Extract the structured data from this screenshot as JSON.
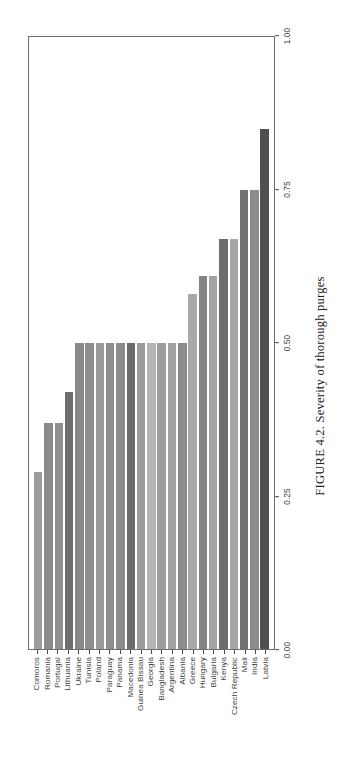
{
  "figure": {
    "caption_prefix": "FIGURE 4.2.",
    "caption_text": "Severity of thorough purges",
    "caption_full": "FIGURE 4.2. Severity of thorough purges",
    "rotation": "90deg-counterclockwise"
  },
  "chart_data": {
    "type": "bar",
    "orientation": "horizontal",
    "title": "",
    "xlabel": "",
    "ylabel": "",
    "xlim": [
      0,
      1.0
    ],
    "grid": false,
    "legend": "none",
    "tick_labels": [
      "0.00",
      "0.25",
      "0.50",
      "0.75",
      "1.00"
    ],
    "tick_values": [
      0.0,
      0.25,
      0.5,
      0.75,
      1.0
    ],
    "categories": [
      "Comoros",
      "Romania",
      "Portugal",
      "Lithuania",
      "Ukraine",
      "Tunisia",
      "Poland",
      "Paraguay",
      "Panama",
      "Macedonia",
      "Guinea Bissau",
      "Georgia",
      "Bangladesh",
      "Argentina",
      "Albania",
      "Greece",
      "Hungary",
      "Bulgaria",
      "Kenya",
      "Czech Republic",
      "Mali",
      "India",
      "Latvia"
    ],
    "values": [
      0.29,
      0.37,
      0.37,
      0.42,
      0.5,
      0.5,
      0.5,
      0.5,
      0.5,
      0.5,
      0.5,
      0.5,
      0.5,
      0.5,
      0.5,
      0.58,
      0.61,
      0.61,
      0.67,
      0.67,
      0.75,
      0.75,
      0.85
    ],
    "bar_colors": [
      "#9c9c9c",
      "#8a8a8a",
      "#8f8f8f",
      "#6e6e6e",
      "#898989",
      "#8e8e8e",
      "#9a9a9a",
      "#8d8d8d",
      "#8c8c8c",
      "#6b6b6b",
      "#9b9b9b",
      "#b4b4b4",
      "#9e9e9e",
      "#a2a2a2",
      "#8b8b8b",
      "#a9a9a9",
      "#848484",
      "#a4a4a4",
      "#6d6d6d",
      "#a6a6a6",
      "#717171",
      "#8b8b8b",
      "#4f4f4f"
    ]
  }
}
